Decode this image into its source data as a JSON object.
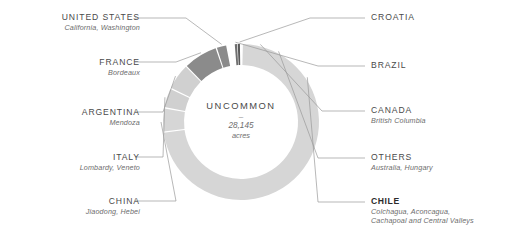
{
  "center": {
    "title": "UNCOMMON",
    "dash": "–",
    "value": "28,145",
    "unit": "acres"
  },
  "colors": {
    "ring_light": "#d6d6d6",
    "ring_mid": "#c9c9c9",
    "ring_dark": "#8b8b8b",
    "ring_darkest": "#5a5a5a",
    "leader_line": "#9a9a9a",
    "text": "#4a4a4a",
    "subtext": "#6d6d6d",
    "background": "#ffffff"
  },
  "labels": [
    {
      "id": "united-states",
      "name": "UNITED STATES",
      "sub": "California, Washington",
      "side": "left",
      "bold": false
    },
    {
      "id": "france",
      "name": "FRANCE",
      "sub": "Bordeaux",
      "side": "left",
      "bold": false
    },
    {
      "id": "argentina",
      "name": "ARGENTINA",
      "sub": "Mendoza",
      "side": "left",
      "bold": false
    },
    {
      "id": "italy",
      "name": "ITALY",
      "sub": "Lombardy, Veneto",
      "side": "left",
      "bold": false
    },
    {
      "id": "china",
      "name": "CHINA",
      "sub": "Jiaodong, Hebei",
      "side": "left",
      "bold": false
    },
    {
      "id": "croatia",
      "name": "CROATIA",
      "sub": "",
      "side": "right",
      "bold": false
    },
    {
      "id": "brazil",
      "name": "BRAZIL",
      "sub": "",
      "side": "right",
      "bold": false
    },
    {
      "id": "canada",
      "name": "CANADA",
      "sub": "British Columbia",
      "side": "right",
      "bold": false
    },
    {
      "id": "others",
      "name": "OTHERS",
      "sub": "Australia, Hungary",
      "side": "right",
      "bold": false
    },
    {
      "id": "chile",
      "name": "CHILE",
      "sub": "Colchagua, Aconcagua,\nCachapoal and Central Valleys",
      "side": "right",
      "bold": true
    }
  ],
  "chart_data": {
    "type": "pie",
    "title": "UNCOMMON",
    "subtitle": "28,145 acres",
    "total": 28145,
    "total_label": "28,145 acres",
    "donut": true,
    "inner_radius_ratio": 0.74,
    "start_angle_deg": 0,
    "direction": "clockwise",
    "legend_position": "outside-leader-lines",
    "grid": false,
    "categories": [
      "Chile",
      "France",
      "United States",
      "Argentina",
      "Italy",
      "China",
      "Others",
      "Canada",
      "Brazil",
      "Croatia"
    ],
    "values": [
      73.0,
      7.0,
      2.0,
      5.5,
      4.0,
      5.0,
      1.6,
      0.9,
      0.6,
      0.4
    ],
    "units": "percent of acreage",
    "segments": [
      {
        "name": "Croatia",
        "start_deg": 357.6,
        "end_deg": 359.2,
        "color": "#5a5a5a",
        "regions": ""
      },
      {
        "name": "Brazil",
        "start_deg": 355.4,
        "end_deg": 357.1,
        "color": "#6f6f6f",
        "regions": ""
      },
      {
        "name": "United States",
        "start_deg": 342.0,
        "end_deg": 349.0,
        "color": "#8b8b8b",
        "regions": "California, Washington"
      },
      {
        "name": "France",
        "start_deg": 316.0,
        "end_deg": 341.0,
        "color": "#8b8b8b",
        "regions": "Bordeaux"
      },
      {
        "name": "Argentina",
        "start_deg": 296.0,
        "end_deg": 315.0,
        "color": "#d0d0d0",
        "regions": "Mendoza"
      },
      {
        "name": "Italy",
        "start_deg": 281.0,
        "end_deg": 295.0,
        "color": "#d0d0d0",
        "regions": "Lombardy, Veneto"
      },
      {
        "name": "China",
        "start_deg": 263.0,
        "end_deg": 280.0,
        "color": "#d6d6d6",
        "regions": "Jiaodong, Hebei"
      },
      {
        "name": "Chile",
        "start_deg": 1.4,
        "end_deg": 262.0,
        "color": "#d6d6d6",
        "regions": "Colchagua, Aconcagua, Cachapoal and Central Valleys"
      }
    ]
  }
}
